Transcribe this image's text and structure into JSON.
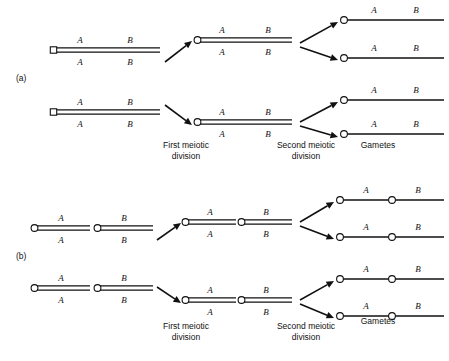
{
  "figure": {
    "width": 449,
    "height": 361,
    "background": "#ffffff",
    "ink_color": "#111111",
    "topic": "Meiotic segregation of alleles A and B"
  },
  "panels": [
    {
      "id": "a",
      "label": "(a)",
      "label_x": 16,
      "label_y": 81,
      "description": "A and B on the same chromosome (linked)",
      "stage_labels": [
        {
          "name": "first-meiotic-division",
          "line1": "First meiotic",
          "line2": "division",
          "x": 186,
          "y": 148
        },
        {
          "name": "second-meiotic-division",
          "line1": "Second meiotic",
          "line2": "division",
          "x": 306,
          "y": 148
        },
        {
          "name": "gametes",
          "line1": "Gametes",
          "line2": "",
          "x": 378,
          "y": 148
        }
      ],
      "cells": [
        {
          "name": "parent-cell-top",
          "type": "bivalent",
          "x": 52,
          "y": 50,
          "length": 108,
          "top_alleles": [
            {
              "text": "A",
              "dx": 28
            },
            {
              "text": "B",
              "dx": 78
            }
          ],
          "bottom_alleles": [
            {
              "text": "A",
              "dx": 28
            },
            {
              "text": "B",
              "dx": 78
            }
          ],
          "centromere": "square"
        },
        {
          "name": "parent-cell-bottom",
          "type": "bivalent",
          "x": 52,
          "y": 112,
          "length": 108,
          "top_alleles": [
            {
              "text": "A",
              "dx": 28
            },
            {
              "text": "B",
              "dx": 78
            }
          ],
          "bottom_alleles": [
            {
              "text": "A",
              "dx": 28
            },
            {
              "text": "B",
              "dx": 78
            }
          ],
          "centromere": "square"
        },
        {
          "name": "meiosis1-product-top",
          "type": "bivalent",
          "x": 196,
          "y": 40,
          "length": 96,
          "top_alleles": [
            {
              "text": "A",
              "dx": 26
            },
            {
              "text": "B",
              "dx": 72
            }
          ],
          "bottom_alleles": [
            {
              "text": "A",
              "dx": 26
            },
            {
              "text": "B",
              "dx": 72
            }
          ],
          "centromere": "circle"
        },
        {
          "name": "meiosis1-product-bottom",
          "type": "bivalent",
          "x": 196,
          "y": 122,
          "length": 96,
          "top_alleles": [
            {
              "text": "A",
              "dx": 26
            },
            {
              "text": "B",
              "dx": 72
            }
          ],
          "bottom_alleles": [
            {
              "text": "A",
              "dx": 26
            },
            {
              "text": "B",
              "dx": 72
            }
          ],
          "centromere": "circle"
        }
      ],
      "gametes": [
        {
          "name": "gamete-a-1",
          "x": 344,
          "y": 20,
          "length": 100,
          "alleles": [
            {
              "text": "A",
              "dx": 30
            },
            {
              "text": "B",
              "dx": 72
            }
          ]
        },
        {
          "name": "gamete-a-2",
          "x": 344,
          "y": 58,
          "length": 100,
          "alleles": [
            {
              "text": "A",
              "dx": 30
            },
            {
              "text": "B",
              "dx": 72
            }
          ]
        },
        {
          "name": "gamete-a-3",
          "x": 344,
          "y": 100,
          "length": 100,
          "alleles": [
            {
              "text": "A",
              "dx": 30
            },
            {
              "text": "B",
              "dx": 72
            }
          ]
        },
        {
          "name": "gamete-a-4",
          "x": 344,
          "y": 134,
          "length": 100,
          "alleles": [
            {
              "text": "A",
              "dx": 30
            },
            {
              "text": "B",
              "dx": 72
            }
          ]
        }
      ],
      "arrows": [
        {
          "name": "arrow-meiosis1-top",
          "x1": 165,
          "y1": 62,
          "x2": 192,
          "y2": 41
        },
        {
          "name": "arrow-meiosis1-bottom",
          "x1": 165,
          "y1": 105,
          "x2": 192,
          "y2": 125
        },
        {
          "name": "arrow-meiosis2-top-up",
          "x1": 300,
          "y1": 43,
          "x2": 338,
          "y2": 22
        },
        {
          "name": "arrow-meiosis2-top-down",
          "x1": 300,
          "y1": 47,
          "x2": 338,
          "y2": 60
        },
        {
          "name": "arrow-meiosis2-bottom-up",
          "x1": 300,
          "y1": 122,
          "x2": 338,
          "y2": 102
        },
        {
          "name": "arrow-meiosis2-bottom-down",
          "x1": 300,
          "y1": 126,
          "x2": 338,
          "y2": 137
        }
      ]
    },
    {
      "id": "b",
      "label": "(b)",
      "label_x": 16,
      "label_y": 259,
      "description": "A and B on different chromosomes (unlinked)",
      "stage_labels": [
        {
          "name": "first-meiotic-division",
          "line1": "First meiotic",
          "line2": "division",
          "x": 186,
          "y": 329
        },
        {
          "name": "second-meiotic-division",
          "line1": "Second meiotic",
          "line2": "division",
          "x": 306,
          "y": 329
        },
        {
          "name": "gametes",
          "line1": "Gametes",
          "line2": "",
          "x": 378,
          "y": 324
        }
      ],
      "cells": [
        {
          "name": "parent-cell-b-top-chromA",
          "type": "bivalent",
          "x": 33,
          "y": 228,
          "length": 57,
          "top_alleles": [
            {
              "text": "A",
              "dx": 28
            }
          ],
          "bottom_alleles": [
            {
              "text": "A",
              "dx": 28
            }
          ],
          "centromere": "circle"
        },
        {
          "name": "parent-cell-b-top-chromB",
          "type": "bivalent",
          "x": 96,
          "y": 228,
          "length": 57,
          "top_alleles": [
            {
              "text": "B",
              "dx": 28
            }
          ],
          "bottom_alleles": [
            {
              "text": "B",
              "dx": 28
            }
          ],
          "centromere": "circle"
        },
        {
          "name": "parent-cell-b-bottom-chromA",
          "type": "bivalent",
          "x": 33,
          "y": 288,
          "length": 57,
          "top_alleles": [
            {
              "text": "A",
              "dx": 28
            }
          ],
          "bottom_alleles": [
            {
              "text": "A",
              "dx": 28
            }
          ],
          "centromere": "circle"
        },
        {
          "name": "parent-cell-b-bottom-chromB",
          "type": "bivalent",
          "x": 96,
          "y": 288,
          "length": 57,
          "top_alleles": [
            {
              "text": "B",
              "dx": 28
            }
          ],
          "bottom_alleles": [
            {
              "text": "B",
              "dx": 28
            }
          ],
          "centromere": "circle"
        },
        {
          "name": "meiosis1-b-top-chromA",
          "type": "bivalent",
          "x": 184,
          "y": 222,
          "length": 52,
          "top_alleles": [
            {
              "text": "A",
              "dx": 26
            }
          ],
          "bottom_alleles": [
            {
              "text": "A",
              "dx": 26
            }
          ],
          "centromere": "circle"
        },
        {
          "name": "meiosis1-b-top-chromB",
          "type": "bivalent",
          "x": 240,
          "y": 222,
          "length": 52,
          "top_alleles": [
            {
              "text": "B",
              "dx": 26
            }
          ],
          "bottom_alleles": [
            {
              "text": "B",
              "dx": 26
            }
          ],
          "centromere": "circle"
        },
        {
          "name": "meiosis1-b-bottom-chromA",
          "type": "bivalent",
          "x": 184,
          "y": 300,
          "length": 52,
          "top_alleles": [
            {
              "text": "A",
              "dx": 26
            }
          ],
          "bottom_alleles": [
            {
              "text": "A",
              "dx": 26
            }
          ],
          "centromere": "circle"
        },
        {
          "name": "meiosis1-b-bottom-chromB",
          "type": "bivalent",
          "x": 240,
          "y": 300,
          "length": 52,
          "top_alleles": [
            {
              "text": "B",
              "dx": 26
            }
          ],
          "bottom_alleles": [
            {
              "text": "B",
              "dx": 26
            }
          ],
          "centromere": "circle"
        }
      ],
      "gametes": [
        {
          "name": "gamete-b-1-chromA",
          "x": 340,
          "y": 200,
          "length": 49,
          "alleles": [
            {
              "text": "A",
              "dx": 26
            }
          ]
        },
        {
          "name": "gamete-b-1-chromB",
          "x": 392,
          "y": 200,
          "length": 52,
          "alleles": [
            {
              "text": "B",
              "dx": 26
            }
          ]
        },
        {
          "name": "gamete-b-2-chromA",
          "x": 340,
          "y": 237,
          "length": 49,
          "alleles": [
            {
              "text": "A",
              "dx": 26
            }
          ]
        },
        {
          "name": "gamete-b-2-chromB",
          "x": 392,
          "y": 237,
          "length": 52,
          "alleles": [
            {
              "text": "B",
              "dx": 26
            }
          ]
        },
        {
          "name": "gamete-b-3-chromA",
          "x": 340,
          "y": 279,
          "length": 49,
          "alleles": [
            {
              "text": "A",
              "dx": 26
            }
          ]
        },
        {
          "name": "gamete-b-3-chromB",
          "x": 392,
          "y": 279,
          "length": 52,
          "alleles": [
            {
              "text": "B",
              "dx": 26
            }
          ]
        },
        {
          "name": "gamete-b-4-chromA",
          "x": 340,
          "y": 316,
          "length": 49,
          "alleles": [
            {
              "text": "A",
              "dx": 26
            }
          ]
        },
        {
          "name": "gamete-b-4-chromB",
          "x": 392,
          "y": 316,
          "length": 52,
          "alleles": [
            {
              "text": "B",
              "dx": 26
            }
          ]
        }
      ],
      "arrows": [
        {
          "name": "arrow-b-meiosis1-top",
          "x1": 157,
          "y1": 240,
          "x2": 181,
          "y2": 223
        },
        {
          "name": "arrow-b-meiosis1-bottom",
          "x1": 157,
          "y1": 287,
          "x2": 181,
          "y2": 303
        },
        {
          "name": "arrow-b-meiosis2-top-up",
          "x1": 300,
          "y1": 222,
          "x2": 334,
          "y2": 202
        },
        {
          "name": "arrow-b-meiosis2-top-down",
          "x1": 300,
          "y1": 226,
          "x2": 334,
          "y2": 239
        },
        {
          "name": "arrow-b-meiosis2-bottom-up",
          "x1": 300,
          "y1": 300,
          "x2": 334,
          "y2": 281
        },
        {
          "name": "arrow-b-meiosis2-bottom-down",
          "x1": 300,
          "y1": 304,
          "x2": 334,
          "y2": 318
        }
      ]
    }
  ]
}
